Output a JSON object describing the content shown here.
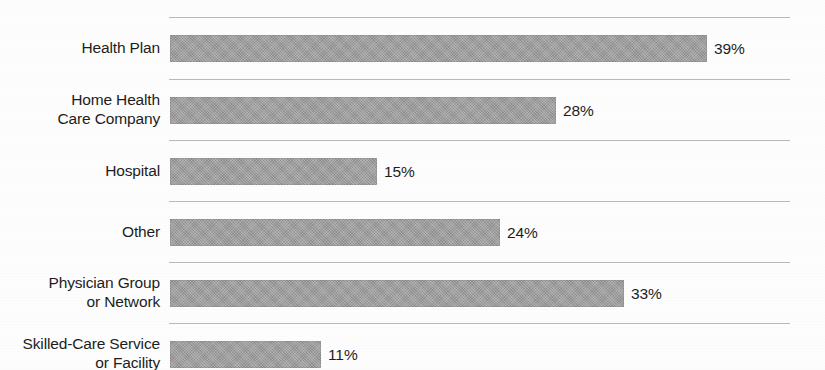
{
  "chart_data": {
    "type": "bar",
    "orientation": "horizontal",
    "title": "",
    "subtitle": "",
    "xlabel": "",
    "ylabel": "",
    "grid": true,
    "legend": null,
    "xlim": [
      0,
      45
    ],
    "value_suffix": "%",
    "categories": [
      "Health Plan",
      "Home Health\nCare Company",
      "Hospital",
      "Other",
      "Physician Group\nor Network",
      "Skilled-Care Service\nor Facility"
    ],
    "values": [
      39,
      28,
      15,
      24,
      33,
      11
    ],
    "value_labels": [
      "39%",
      "28%",
      "15%",
      "24%",
      "33%",
      "11%"
    ],
    "colors": {
      "bar_fill": "#9c9c9c",
      "gridline": "#b9b9b9",
      "text": "#1d1d1d",
      "background": "#fdfdfd"
    }
  },
  "rows": [
    {
      "label": "Health Plan",
      "value_label": "39%",
      "lines": 1
    },
    {
      "label": "Home Health\nCare Company",
      "value_label": "28%",
      "lines": 2
    },
    {
      "label": "Hospital",
      "value_label": "15%",
      "lines": 1
    },
    {
      "label": "Other",
      "value_label": "24%",
      "lines": 1
    },
    {
      "label": "Physician Group\nor Network",
      "value_label": "33%",
      "lines": 2
    },
    {
      "label": "Skilled-Care Service\nor Facility",
      "value_label": "11%",
      "lines": 2
    }
  ]
}
